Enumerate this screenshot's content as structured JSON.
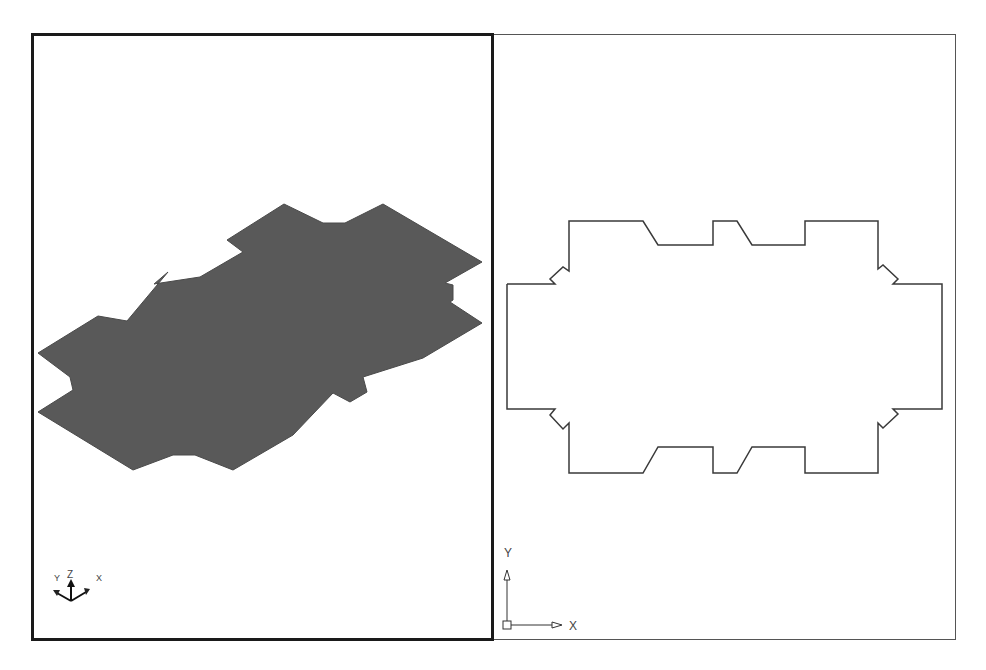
{
  "viewports": {
    "left": {
      "name": "3D isometric view",
      "active": true,
      "shape_fill": "#595959",
      "ucs_icon": {
        "type": "3d",
        "labels": {
          "x": "X",
          "y": "Y",
          "z": "Z"
        }
      }
    },
    "right": {
      "name": "Top (plan) view",
      "active": false,
      "outline_color": "#3a3a3a",
      "ucs_icon": {
        "type": "2d",
        "labels": {
          "x": "X",
          "y": "Y"
        }
      }
    }
  },
  "colors": {
    "background": "#ffffff",
    "active_border": "#1a1a1a",
    "inactive_border": "#555555"
  }
}
